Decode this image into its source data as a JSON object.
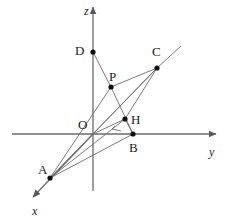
{
  "figure": {
    "background_color": "#ffffff",
    "line_color": "#6b6b6b",
    "axis_color": "#6b6b6b",
    "point_color": "#111111",
    "label_color": "#1a1a1a",
    "width": 229,
    "height": 219
  },
  "axes": [
    {
      "id": "x",
      "label": "x",
      "label_x": 32,
      "label_y": 205,
      "from_x": 93,
      "from_y": 134,
      "to_x": 33,
      "to_y": 197,
      "arrow": true
    },
    {
      "id": "y",
      "label": "y",
      "label_x": 209,
      "label_y": 146,
      "from_x": 12,
      "from_y": 134,
      "to_x": 216,
      "to_y": 134,
      "arrow": true
    },
    {
      "id": "z",
      "label": "z",
      "label_x": 84,
      "label_y": 5,
      "from_x": 93,
      "from_y": 191,
      "to_x": 93,
      "to_y": 7,
      "arrow": true
    }
  ],
  "points": [
    {
      "id": "O",
      "label": "O",
      "x": 93,
      "y": 134,
      "label_x": 78,
      "label_y": 118,
      "dot": false
    },
    {
      "id": "A",
      "label": "A",
      "x": 50,
      "y": 178,
      "label_x": 38,
      "label_y": 163,
      "dot": true
    },
    {
      "id": "B",
      "label": "B",
      "x": 133,
      "y": 134,
      "label_x": 129,
      "label_y": 141,
      "dot": true
    },
    {
      "id": "C",
      "label": "C",
      "x": 157,
      "y": 68,
      "label_x": 152,
      "label_y": 45,
      "dot": true
    },
    {
      "id": "D",
      "label": "D",
      "x": 93,
      "y": 52,
      "label_x": 75,
      "label_y": 44,
      "dot": true
    },
    {
      "id": "P",
      "label": "P",
      "x": 111,
      "y": 87,
      "label_x": 109,
      "label_y": 70,
      "dot": true
    },
    {
      "id": "H",
      "label": "H",
      "x": 125,
      "y": 119,
      "label_x": 131,
      "label_y": 113,
      "dot": true
    }
  ],
  "segments": [
    {
      "id": "D-P",
      "from": "D",
      "to": "P"
    },
    {
      "id": "P-B",
      "from": "P",
      "to": "B"
    },
    {
      "id": "P-C",
      "from": "P",
      "to": "C"
    },
    {
      "id": "A-P",
      "from": "A",
      "to": "P"
    },
    {
      "id": "A-O",
      "from": "A",
      "to": "O"
    },
    {
      "id": "A-B",
      "from": "A",
      "to": "B"
    },
    {
      "id": "A-H",
      "from": "A",
      "to": "H"
    },
    {
      "id": "A-C",
      "from": "A",
      "to": "C"
    },
    {
      "id": "O-H",
      "from": "O",
      "to": "H"
    },
    {
      "id": "O-C",
      "from": "O",
      "to": "C"
    },
    {
      "id": "H-C",
      "from": "H",
      "to": "C"
    },
    {
      "id": "B-H",
      "from": "B",
      "to": "H"
    }
  ],
  "ray": {
    "id": "ray-OC-extension",
    "from_x": 157,
    "from_y": 68,
    "to_x": 181,
    "to_y": 46
  },
  "right_angle": {
    "id": "right-angle-at-H",
    "vertex_x": 125,
    "vertex_y": 119,
    "p1_x": 115,
    "p1_y": 126,
    "p2_x": 121,
    "p2_y": 131,
    "corner_x": 112,
    "corner_y": 129
  }
}
